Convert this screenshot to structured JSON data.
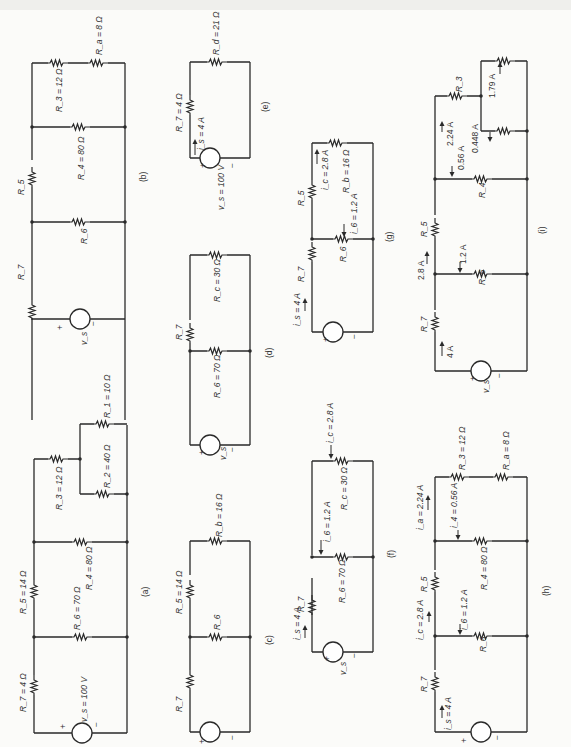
{
  "figure": {
    "orientation": "rotated 90 degrees counter-clockwise",
    "panels": {
      "a": {
        "caption": "(a)",
        "labels": {
          "vs": "v_s = 100 V",
          "R7": "R_7 = 4 Ω",
          "R5": "R_5 = 14 Ω",
          "R6": "R_6 = 70 Ω",
          "R4": "R_4 = 80 Ω",
          "R3": "R_3 = 12 Ω",
          "R2": "R_2 = 40 Ω",
          "R1": "R_1 = 10 Ω"
        },
        "source_plus": "+",
        "source_minus": "−"
      },
      "b": {
        "caption": "(b)",
        "labels": {
          "vs": "v_s",
          "R7": "R_7",
          "R6": "R_6",
          "R5": "R_5",
          "R4": "R_4 = 80 Ω",
          "R3": "R_3 = 12 Ω",
          "Ra": "R_a = 8 Ω"
        },
        "source_plus": "+",
        "source_minus": "−"
      },
      "c": {
        "caption": "(c)",
        "labels": {
          "R7": "R_7",
          "R6": "R_6",
          "R5": "R_5 = 14 Ω",
          "Rb": "R_b = 16 Ω"
        },
        "source_plus": "+",
        "source_minus": "−"
      },
      "d": {
        "caption": "(d)",
        "labels": {
          "vs": "v_s",
          "R7": "R_7",
          "R6": "R_6 = 70 Ω",
          "Rc": "R_c = 30 Ω"
        },
        "source_plus": "+",
        "source_minus": "−"
      },
      "e": {
        "caption": "(e)",
        "labels": {
          "vs": "v_s = 100 V",
          "is": "i_s = 4 A",
          "R7": "R_7 = 4 Ω",
          "Rd": "R_d = 21 Ω"
        },
        "source_plus": "+",
        "source_minus": "−"
      },
      "f": {
        "caption": "(f)",
        "labels": {
          "vs": "v_s",
          "is": "i_s = 4 A",
          "R7": "R_7",
          "R6": "R_6 = 70 Ω",
          "i6": "i_6 = 1.2 A",
          "Rc": "R_c = 30 Ω",
          "ic": "i_c = 2.8 A"
        },
        "source_plus": "+",
        "source_minus": "−"
      },
      "g": {
        "caption": "(g)",
        "labels": {
          "is": "i_s = 4 A",
          "R7": "R_7",
          "R6": "R_6",
          "i6": "i_6 = 1.2 A",
          "R5": "R_5",
          "ic": "i_c = 2.8 A",
          "Rb": "R_b = 16 Ω"
        },
        "source_plus": "+",
        "source_minus": "−"
      },
      "h": {
        "caption": "(h)",
        "labels": {
          "is": "i_s = 4 A",
          "R7": "R_7",
          "R6": "R_6",
          "i6": "i_6 = 1.2 A",
          "ic": "i_c = 2.8 A",
          "R5": "R_5",
          "R4": "R_4 = 80 Ω",
          "i4": "i_4 = 0.56 A",
          "ia": "i_a = 2.24 A",
          "R3": "R_3 = 12 Ω",
          "Ra": "R_a = 8 Ω"
        },
        "source_plus": "+",
        "source_minus": "−"
      },
      "i": {
        "caption": "(i)",
        "labels": {
          "vs": "v_s",
          "is": "4 A",
          "R7": "R_7",
          "i_R5": "2.8 A",
          "R5": "R_5",
          "R6": "R_6",
          "i6": "1.2 A",
          "R4": "R_4",
          "i4": "0.56 A",
          "ia": "2.24 A",
          "R3": "R_3",
          "i2": "0.448 A",
          "i1": "1.79 A"
        },
        "source_plus": "+",
        "source_minus": "−"
      }
    }
  }
}
